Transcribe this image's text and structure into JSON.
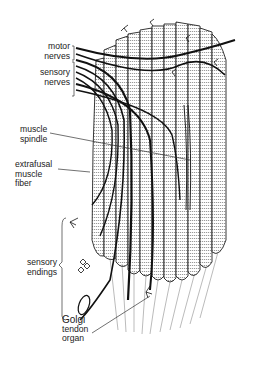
{
  "figure": {
    "type": "anatomical illustration",
    "colors": {
      "ink": "#111111",
      "background": "#ffffff",
      "label_text": "#222222"
    }
  },
  "labels": {
    "motor_nerves": {
      "line1": "motor",
      "line2": "nerves"
    },
    "sensory_nerves": {
      "line1": "sensory",
      "line2": "nerves"
    },
    "muscle_spindle": {
      "line1": "muscle",
      "line2": "spindle"
    },
    "extrafusal_fiber": {
      "line1": "extrafusal",
      "line2": "muscle",
      "line3": "fiber"
    },
    "sensory_endings": {
      "line1": "sensory",
      "line2": "endings"
    },
    "golgi_tendon_organ": {
      "line1": "Golgi",
      "line2": "tendon",
      "line3": "organ"
    }
  }
}
